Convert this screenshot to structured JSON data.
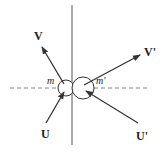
{
  "diagram": {
    "type": "collision-vector-diagram",
    "labels": {
      "v": "V",
      "v_prime": "V'",
      "u": "U",
      "u_prime": "U'",
      "m": "m",
      "m_prime": "m'"
    },
    "colors": {
      "line": "#333333",
      "axis": "#555555",
      "text": "#222222"
    }
  }
}
